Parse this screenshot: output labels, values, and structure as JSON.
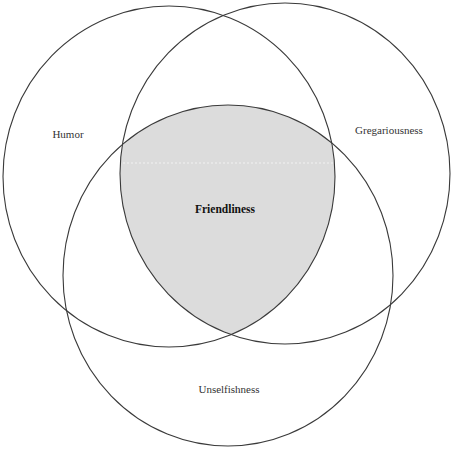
{
  "diagram": {
    "type": "venn",
    "sets": [
      {
        "id": "humor",
        "label": "Humor"
      },
      {
        "id": "gregariousness",
        "label": "Gregariousness"
      },
      {
        "id": "unselfishness",
        "label": "Unselfishness"
      }
    ],
    "intersection": {
      "sets": [
        "humor",
        "gregariousness",
        "unselfishness"
      ],
      "label": "Friendliness",
      "fill": "#dcdcdc"
    },
    "colors": {
      "stroke": "#3a3a3a",
      "background": "#ffffff",
      "intersection_fill": "#dcdcdc"
    }
  }
}
